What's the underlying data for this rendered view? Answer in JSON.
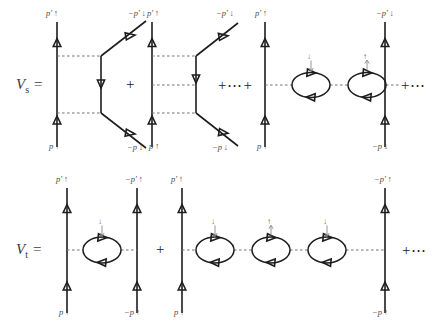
{
  "figure": {
    "background_color": "#ffffff",
    "line_color": "#1d1d1d",
    "dashed_color": "#6f6f6f",
    "text_color": "#3a3a3a"
  },
  "rows": [
    {
      "id": "singlet",
      "equation_label": "V",
      "equation_subscript": "s",
      "equation_equals": "=",
      "terms": [
        {
          "id": "s-term-1",
          "type": "crossed-ladder-1",
          "top_left_label": "p′ ↑",
          "top_right_label": "−p′ ↓",
          "bottom_left_label": "p ↑",
          "bottom_right_label": "−p ↓"
        },
        {
          "id": "s-sep-1",
          "type": "operator",
          "text": "+"
        },
        {
          "id": "s-term-2",
          "type": "crossed-ladder-2",
          "top_left_label": "p′ ↑",
          "top_right_label": "−p′ ↓",
          "bottom_left_label": "p ↑",
          "bottom_right_label": "−p ↓"
        },
        {
          "id": "s-sep-2",
          "type": "operator",
          "text": "+⋯+"
        },
        {
          "id": "s-term-3",
          "type": "bubble-chain",
          "bubble_count": 2,
          "bubble_spins": [
            "↓",
            "↑"
          ],
          "top_left_label": "p′ ↑",
          "top_right_label": "−p′ ↓",
          "bottom_left_label": "p ↑",
          "bottom_right_label": "−p ↓"
        },
        {
          "id": "s-sep-3",
          "type": "operator",
          "text": "+⋯"
        }
      ]
    },
    {
      "id": "triplet",
      "equation_label": "V",
      "equation_subscript": "t",
      "equation_equals": "=",
      "terms": [
        {
          "id": "t-term-1",
          "type": "bubble-chain",
          "bubble_count": 1,
          "bubble_spins": [
            "↓"
          ],
          "top_left_label": "p′ ↑",
          "top_right_label": "−p′ ↑",
          "bottom_left_label": "p ↑",
          "bottom_right_label": "−p ↑"
        },
        {
          "id": "t-sep-1",
          "type": "operator",
          "text": "+"
        },
        {
          "id": "t-term-2",
          "type": "bubble-chain",
          "bubble_count": 3,
          "bubble_spins": [
            "↓",
            "↑",
            "↓"
          ],
          "top_left_label": "p′ ↑",
          "top_right_label": "−p′ ↑",
          "bottom_left_label": "p ↑",
          "bottom_right_label": "−p ↑"
        },
        {
          "id": "t-sep-2",
          "type": "operator",
          "text": "+⋯"
        }
      ]
    }
  ],
  "labels": {
    "row1_eq_V": "V",
    "row1_eq_sub": "s",
    "row1_eq_equals": "=",
    "row2_eq_V": "V",
    "row2_eq_sub": "t",
    "row2_eq_equals": "=",
    "r1_d1_tl": "p′ ↑",
    "r1_d1_bl": "p ↑",
    "r1_d1_tr": "−p′ ↓",
    "r1_d1_br": "−p ↓",
    "r1_plus_1": "+",
    "r1_d2_tl": "p′ ↑",
    "r1_d2_bl": "p ↑",
    "r1_d2_tr": "−p′ ↓",
    "r1_d2_br": "−p ↓",
    "r1_plus_2": "+⋯+",
    "r1_d3_tl": "p′ ↑",
    "r1_d3_bl": "p ↑",
    "r1_d3_tr": "−p′ ↓",
    "r1_d3_br": "−p ↓",
    "r1_d3_spin1": "↓",
    "r1_d3_spin2": "↑",
    "r1_plus_3": "+⋯",
    "r2_d1_tl": "p′ ↑",
    "r2_d1_bl": "p ↑",
    "r2_d1_tr": "−p′ ↑",
    "r2_d1_br": "−p ↑",
    "r2_d1_spin1": "↓",
    "r2_plus_1": "+",
    "r2_d2_tl": "p′ ↑",
    "r2_d2_bl": "p ↑",
    "r2_d2_tr": "−p′ ↑",
    "r2_d2_br": "−p ↑",
    "r2_d2_spin1": "↓",
    "r2_d2_spin2": "↑",
    "r2_d2_spin3": "↓",
    "r2_plus_2": "+⋯"
  }
}
